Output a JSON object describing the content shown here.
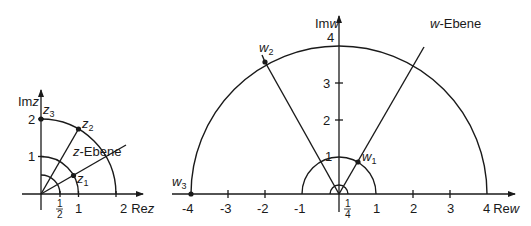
{
  "z_plane": {
    "title_var": "z",
    "title_suffix": "-Ebene",
    "x_axis_label": "Re",
    "x_axis_var": "z",
    "y_axis_label": "Im",
    "y_axis_var": "z",
    "x_ticks": [
      "1",
      "2"
    ],
    "x_fraction": {
      "num": "1",
      "den": "2"
    },
    "y_ticks": [
      "1",
      "2"
    ],
    "points": [
      {
        "label": "z",
        "sub": "1"
      },
      {
        "label": "z",
        "sub": "2"
      },
      {
        "label": "z",
        "sub": "3"
      }
    ]
  },
  "w_plane": {
    "title_var": "w",
    "title_suffix": "-Ebene",
    "x_axis_label": "Re",
    "x_axis_var": "w",
    "y_axis_label": "Im",
    "y_axis_var": "w",
    "x_ticks": [
      "-4",
      "-3",
      "-2",
      "-1",
      "1",
      "2",
      "3",
      "4"
    ],
    "x_fraction": {
      "num": "1",
      "den": "4"
    },
    "y_ticks": [
      "1",
      "2",
      "3",
      "4"
    ],
    "points": [
      {
        "label": "w",
        "sub": "1"
      },
      {
        "label": "w",
        "sub": "2"
      },
      {
        "label": "w",
        "sub": "3"
      }
    ]
  }
}
